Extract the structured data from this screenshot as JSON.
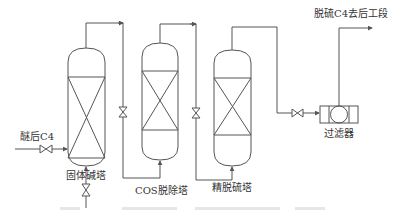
{
  "diagram": {
    "type": "process-flow",
    "feed_label": "醚后C4",
    "product_label": "脱硫C4去后工段",
    "equipment": [
      {
        "id": "tower-1",
        "label": "固体碱塔"
      },
      {
        "id": "tower-2",
        "label": "COS脱除塔"
      },
      {
        "id": "tower-3",
        "label": "精脱硫塔"
      },
      {
        "id": "filter",
        "label": "过滤器"
      }
    ],
    "line_color": "#555555",
    "text_color": "#333333"
  }
}
